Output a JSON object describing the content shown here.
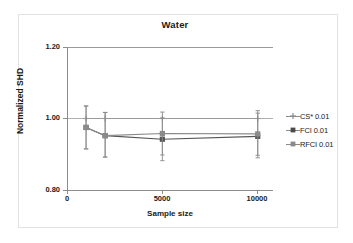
{
  "chart_data": {
    "type": "line",
    "title": "Water",
    "xlabel": "Sample size",
    "ylabel": "Normalized SHD",
    "x": [
      1000,
      2000,
      5000,
      10000
    ],
    "xlim": [
      0,
      10800
    ],
    "ylim": [
      0.8,
      1.2
    ],
    "xticks": [
      "0",
      "5000",
      "10000"
    ],
    "xtick_values": [
      0,
      5000,
      10000
    ],
    "yticks": [
      "0.80",
      "1.00",
      "1.20"
    ],
    "ytick_values": [
      0.8,
      1.0,
      1.2
    ],
    "grid": true,
    "legend_position": "right",
    "series": [
      {
        "name": "CS* 0.01",
        "color": "#9a9a9a",
        "marker": "plus",
        "values": [
          1.0,
          1.0,
          1.0,
          1.0
        ],
        "err_low": [
          0,
          0,
          0,
          0
        ],
        "err_high": [
          0,
          0,
          0,
          0
        ]
      },
      {
        "name": "FCI 0.01",
        "color": "#555555",
        "marker": "square",
        "values": [
          0.975,
          0.952,
          0.942,
          0.95
        ],
        "err_low": [
          0.06,
          0.06,
          0.06,
          0.06
        ],
        "err_high": [
          0.06,
          0.065,
          0.06,
          0.065
        ]
      },
      {
        "name": "RFCI 0.01",
        "color": "#8a8a8a",
        "marker": "square",
        "values": [
          0.975,
          0.952,
          0.958,
          0.957
        ],
        "err_low": [
          0.06,
          0.06,
          0.06,
          0.06
        ],
        "err_high": [
          0.06,
          0.065,
          0.06,
          0.065
        ]
      }
    ]
  },
  "legend": {
    "entries": [
      {
        "label": "CS* 0.01"
      },
      {
        "label": "FCI 0.01"
      },
      {
        "label": "RFCI 0.01"
      }
    ]
  },
  "axes": {
    "y_labels": [
      "1.20",
      "1.00",
      "0.80"
    ],
    "x_labels": [
      "0",
      "5000",
      "10000"
    ],
    "y_title": "Normalized SHD",
    "x_title": "Sample size"
  },
  "title": "Water"
}
